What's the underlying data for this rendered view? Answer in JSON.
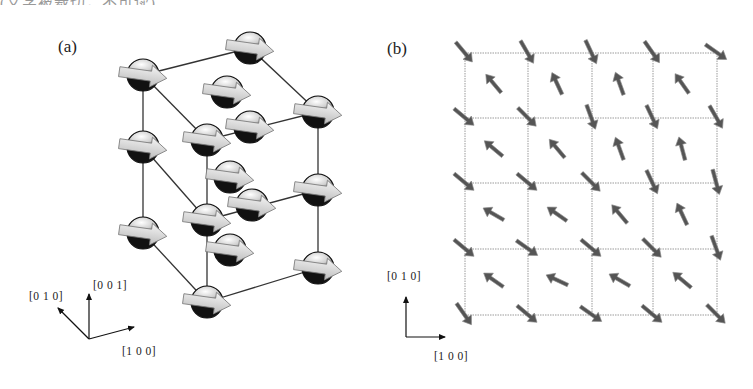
{
  "cropped_caption_text": "(文字被裁切，不可读)",
  "panel_a": {
    "label": "(a)",
    "axes": {
      "x": "[1 0 0]",
      "y": "[0 1 0]",
      "z": "[0 0 1]"
    },
    "description": "3D cubic lattice with magnetic moment arrows on spherical atoms"
  },
  "panel_b": {
    "label": "(b)",
    "axes": {
      "x": "[1 0 0]",
      "y": "[0 1 0]"
    },
    "grid": {
      "cols": 4,
      "rows": 4,
      "x": [
        465,
        528,
        592,
        653,
        717
      ],
      "y": [
        53,
        118,
        183,
        249,
        315
      ]
    },
    "corner_arrow_angles": [
      [
        50,
        60,
        65,
        55,
        35
      ],
      [
        40,
        45,
        70,
        65,
        60
      ],
      [
        40,
        40,
        45,
        65,
        75
      ],
      [
        40,
        35,
        40,
        45,
        70
      ],
      [
        55,
        40,
        35,
        40,
        45
      ]
    ],
    "center_arrow_angles": [
      [
        230,
        245,
        250,
        235
      ],
      [
        220,
        230,
        250,
        255
      ],
      [
        210,
        215,
        230,
        245
      ],
      [
        215,
        205,
        210,
        220
      ]
    ]
  },
  "colors": {
    "line": "#333333",
    "arrow": "#555555",
    "atom_dark": "#111111",
    "grid": "#9a9a9a"
  }
}
